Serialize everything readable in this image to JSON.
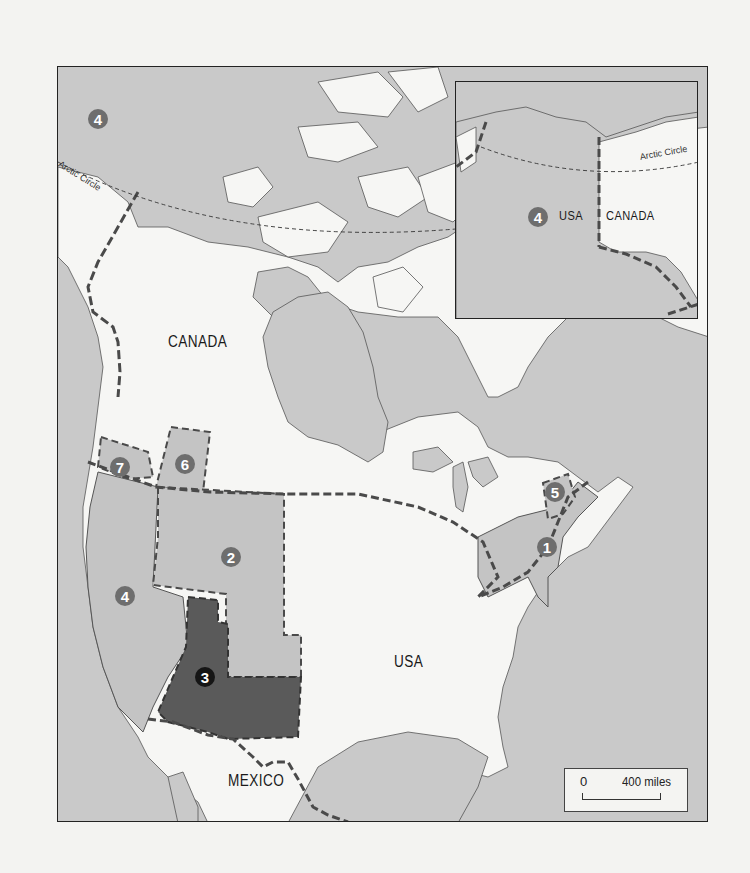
{
  "map": {
    "main_labels": {
      "canada": "CANADA",
      "usa": "USA",
      "mexico": "MEXICO",
      "arctic_circle": "Arctic Circle"
    },
    "region_markers": [
      {
        "id": "1",
        "label": "1",
        "region": "northeast",
        "style": "medium-gray"
      },
      {
        "id": "2",
        "label": "2",
        "region": "northern-plains-rockies",
        "style": "medium-gray"
      },
      {
        "id": "3",
        "label": "3",
        "region": "southwest",
        "style": "dark"
      },
      {
        "id": "4",
        "label": "4",
        "region": "pacific-coast",
        "style": "medium-gray"
      },
      {
        "id": "4b",
        "label": "4",
        "region": "alaska-yukon",
        "style": "medium-gray"
      },
      {
        "id": "5",
        "label": "5",
        "region": "maine",
        "style": "medium-gray"
      },
      {
        "id": "6",
        "label": "6",
        "region": "north-idaho-montana",
        "style": "medium-gray"
      },
      {
        "id": "7",
        "label": "7",
        "region": "pacific-northwest",
        "style": "medium-gray"
      }
    ],
    "inset": {
      "marker": "4",
      "label_usa": "USA",
      "label_canada": "CANADA",
      "arctic_circle": "Arctic Circle"
    },
    "scale": {
      "zero": "0",
      "max": "400 miles"
    },
    "colors": {
      "water": "#c9c9c9",
      "land": "#f6f6f4",
      "region_fill": "#c4c4c4",
      "region_dark": "#5a5a5a",
      "border_dash": "#4a4a4a"
    }
  }
}
